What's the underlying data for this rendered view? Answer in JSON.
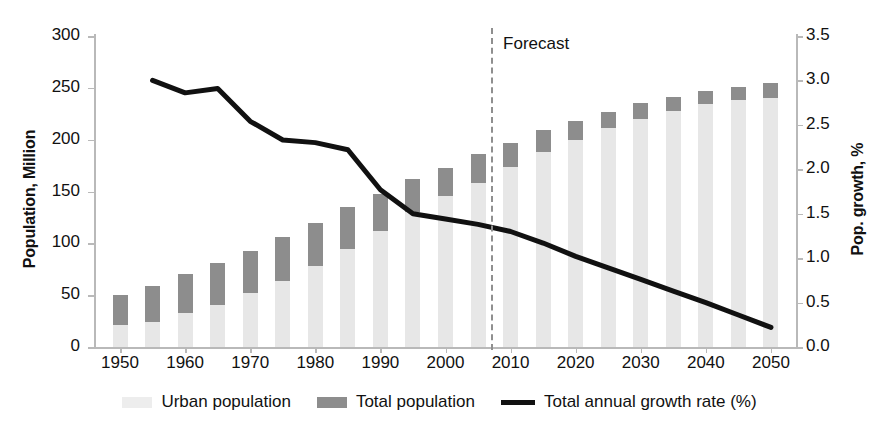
{
  "chart_data": {
    "type": "bar",
    "title": "",
    "subtitle": "",
    "xlabel": "",
    "ylabel": "Population, Million",
    "y2label": "Pop. growth, %",
    "ylim": [
      0,
      300
    ],
    "y2lim": [
      0.0,
      3.5
    ],
    "grid": false,
    "legend_position": "bottom",
    "x_tick_labels": [
      "1950",
      "1960",
      "1970",
      "1980",
      "1990",
      "2000",
      "2010",
      "2020",
      "2030",
      "2040",
      "2050"
    ],
    "y_tick_labels": [
      "0",
      "50",
      "100",
      "150",
      "200",
      "250",
      "300"
    ],
    "y2_tick_labels": [
      "0.0",
      "0.5",
      "1.0",
      "1.5",
      "2.0",
      "2.5",
      "3.0",
      "3.5"
    ],
    "categories": [
      1950,
      1955,
      1960,
      1965,
      1970,
      1975,
      1980,
      1985,
      1990,
      1995,
      2000,
      2005,
      2010,
      2015,
      2020,
      2025,
      2030,
      2035,
      2040,
      2045,
      2050
    ],
    "series": [
      {
        "name": "Urban population",
        "axis": "left",
        "type": "bar-segment",
        "color": "#e7e7e7",
        "values": [
          21,
          24,
          33,
          41,
          52,
          64,
          78,
          95,
          112,
          130,
          146,
          158,
          174,
          188,
          200,
          211,
          220,
          228,
          234,
          238,
          240
        ]
      },
      {
        "name": "Total population",
        "axis": "left",
        "type": "bar-total",
        "color": "#8d8d8d",
        "values": [
          50,
          59,
          70,
          81,
          93,
          106,
          120,
          135,
          148,
          162,
          173,
          186,
          197,
          209,
          218,
          227,
          235,
          241,
          247,
          251,
          255
        ]
      },
      {
        "name": "Total annual growth rate (%)",
        "axis": "right",
        "type": "line",
        "color": "#111111",
        "x": [
          1955,
          1960,
          1965,
          1970,
          1975,
          1980,
          1985,
          1990,
          1995,
          2000,
          2005,
          2010,
          2015,
          2020,
          2025,
          2030,
          2035,
          2040,
          2045,
          2050
        ],
        "values": [
          3.0,
          2.86,
          2.91,
          2.54,
          2.33,
          2.3,
          2.22,
          1.77,
          1.5,
          1.44,
          1.38,
          1.3,
          1.17,
          1.02,
          0.89,
          0.76,
          0.63,
          0.5,
          0.36,
          0.22
        ]
      }
    ],
    "annotations": [
      {
        "name": "forecast-divider",
        "label": "Forecast",
        "x": 2007,
        "style": "dashed-vertical-line"
      }
    ]
  },
  "legend": {
    "items": [
      {
        "label": "Urban population",
        "marker": "swatch-light-gray"
      },
      {
        "label": "Total population",
        "marker": "swatch-dark-gray"
      },
      {
        "label": "Total annual growth rate (%)",
        "marker": "black-line"
      }
    ]
  }
}
